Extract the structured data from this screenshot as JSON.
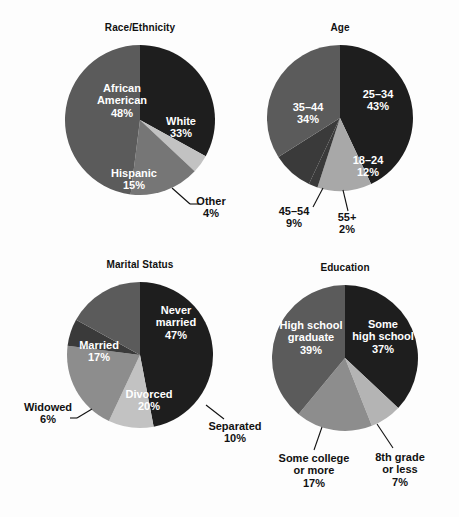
{
  "figure": {
    "background": "#fdfdfd",
    "width": 459,
    "height": 517
  },
  "palette": {
    "dark": "#1e1e1e",
    "mid_dark": "#3a3a3a",
    "mid": "#5b5b5b",
    "mid_light": "#767676",
    "light": "#a8a8a8",
    "lighter": "#c2c2c2",
    "label_inside": "#ffffff",
    "label_outside": "#111111"
  },
  "chart_data": [
    {
      "type": "pie",
      "title": "Race/Ethnicity",
      "categories": [
        "White",
        "Other",
        "Hispanic",
        "African American"
      ],
      "values": [
        33,
        4,
        15,
        48
      ],
      "labels": [
        "White\n33%",
        "Other\n4%",
        "Hispanic\n15%",
        "African\nAmerican\n48%"
      ],
      "colors": [
        "#1e1e1e",
        "#c2c2c2",
        "#767676",
        "#5b5b5b"
      ],
      "label_placement": [
        "inside",
        "outside",
        "inside",
        "inside"
      ],
      "start_angle_deg": 0,
      "legend": "none",
      "grid": false
    },
    {
      "type": "pie",
      "title": "Age",
      "categories": [
        "25–34",
        "18–24",
        "55+",
        "45–54",
        "35–44"
      ],
      "values": [
        43,
        12,
        2,
        9,
        34
      ],
      "labels": [
        "25–34\n43%",
        "18–24\n12%",
        "55+\n2%",
        "45–54\n9%",
        "35–44\n34%"
      ],
      "colors": [
        "#1e1e1e",
        "#a8a8a8",
        "#3a3a3a",
        "#3a3a3a",
        "#5b5b5b"
      ],
      "label_placement": [
        "inside",
        "inside",
        "outside",
        "outside",
        "inside"
      ],
      "start_angle_deg": 0,
      "legend": "none",
      "grid": false
    },
    {
      "type": "pie",
      "title": "Marital Status",
      "categories": [
        "Never married",
        "Separated",
        "Divorced",
        "Widowed",
        "Married"
      ],
      "values": [
        47,
        10,
        20,
        6,
        17
      ],
      "labels": [
        "Never\nmarried\n47%",
        "Separated\n10%",
        "Divorced\n20%",
        "Widowed\n6%",
        "Married\n17%"
      ],
      "colors": [
        "#1e1e1e",
        "#c2c2c2",
        "#8d8d8d",
        "#3a3a3a",
        "#5b5b5b"
      ],
      "label_placement": [
        "inside",
        "outside",
        "inside",
        "outside",
        "inside"
      ],
      "start_angle_deg": 0,
      "legend": "none",
      "grid": false
    },
    {
      "type": "pie",
      "title": "Education",
      "categories": [
        "Some high school",
        "8th grade or less",
        "Some college or more",
        "High school graduate"
      ],
      "values": [
        37,
        7,
        17,
        39
      ],
      "labels": [
        "Some\nhigh school\n37%",
        "8th grade\nor less\n7%",
        "Some college\nor more\n17%",
        "High school\ngraduate\n39%"
      ],
      "colors": [
        "#1e1e1e",
        "#b4b4b4",
        "#8d8d8d",
        "#5b5b5b"
      ],
      "label_placement": [
        "inside",
        "outside",
        "outside",
        "inside"
      ],
      "start_angle_deg": 0,
      "legend": "none",
      "grid": false
    }
  ],
  "panels": [
    {
      "id": "race-ethnicity",
      "title": "Race/Ethnicity",
      "center": {
        "x": 140,
        "y": 120
      },
      "radius": 75,
      "labels": [
        {
          "name": "slice-label-white",
          "text": "White\n33%",
          "x": 181,
          "y": 127,
          "placement": "inside"
        },
        {
          "name": "slice-label-other",
          "text": "Other\n4%",
          "x": 211,
          "y": 207,
          "placement": "outside"
        },
        {
          "name": "slice-label-hispanic",
          "text": "Hispanic\n15%",
          "x": 134,
          "y": 179,
          "placement": "inside"
        },
        {
          "name": "slice-label-african-american",
          "text": "African\nAmerican\n48%",
          "x": 122,
          "y": 100,
          "placement": "inside"
        }
      ],
      "leaders": [
        {
          "name": "leader-other",
          "x1": 172,
          "y1": 188,
          "x2": 190,
          "y2": 204,
          "x3": 199,
          "y3": 204
        }
      ]
    },
    {
      "id": "age",
      "title": "Age",
      "center": {
        "x": 340,
        "y": 118
      },
      "radius": 73,
      "labels": [
        {
          "name": "slice-label-25-34",
          "text": "25–34\n43%",
          "x": 378,
          "y": 100,
          "placement": "inside"
        },
        {
          "name": "slice-label-18-24",
          "text": "18–24\n12%",
          "x": 368,
          "y": 166,
          "placement": "inside"
        },
        {
          "name": "slice-label-55plus",
          "text": "55+\n2%",
          "x": 347,
          "y": 223,
          "placement": "outside"
        },
        {
          "name": "slice-label-45-54",
          "text": "45–54\n9%",
          "x": 294,
          "y": 217,
          "placement": "outside"
        },
        {
          "name": "slice-label-35-44",
          "text": "35–44\n34%",
          "x": 308,
          "y": 113,
          "placement": "inside"
        }
      ],
      "leaders": [
        {
          "name": "leader-55plus",
          "x1": 343,
          "y1": 190,
          "x2": 348,
          "y2": 211,
          "x3": 348,
          "y3": 211
        },
        {
          "name": "leader-45-54",
          "x1": 323,
          "y1": 188,
          "x2": 313,
          "y2": 207,
          "x3": 313,
          "y3": 207
        }
      ]
    },
    {
      "id": "marital-status",
      "title": "Marital Status",
      "center": {
        "x": 140,
        "y": 355
      },
      "radius": 73,
      "labels": [
        {
          "name": "slice-label-never-married",
          "text": "Never\nmarried\n47%",
          "x": 176,
          "y": 322,
          "placement": "inside"
        },
        {
          "name": "slice-label-separated",
          "text": "Separated\n10%",
          "x": 235,
          "y": 432,
          "placement": "outside"
        },
        {
          "name": "slice-label-divorced",
          "text": "Divorced\n20%",
          "x": 149,
          "y": 400,
          "placement": "inside"
        },
        {
          "name": "slice-label-widowed",
          "text": "Widowed\n6%",
          "x": 48,
          "y": 413,
          "placement": "outside"
        },
        {
          "name": "slice-label-married",
          "text": "Married\n17%",
          "x": 99,
          "y": 351,
          "placement": "inside"
        }
      ],
      "leaders": [
        {
          "name": "leader-separated",
          "x1": 206,
          "y1": 405,
          "x2": 224,
          "y2": 419,
          "x3": 224,
          "y3": 419
        },
        {
          "name": "leader-widowed",
          "x1": 92,
          "y1": 409,
          "x2": 77,
          "y2": 418,
          "x3": 70,
          "y3": 418
        }
      ]
    },
    {
      "id": "education",
      "title": "Education",
      "center": {
        "x": 345,
        "y": 358
      },
      "radius": 73,
      "labels": [
        {
          "name": "slice-label-some-high-school",
          "text": "Some\nhigh school\n37%",
          "x": 383,
          "y": 336,
          "placement": "inside"
        },
        {
          "name": "slice-label-8th-grade-or-less",
          "text": "8th grade\nor less\n7%",
          "x": 400,
          "y": 469,
          "placement": "outside"
        },
        {
          "name": "slice-label-some-college-or-more",
          "text": "Some college\nor more\n17%",
          "x": 314,
          "y": 470,
          "placement": "outside"
        },
        {
          "name": "slice-label-high-school-graduate",
          "text": "High school\ngraduate\n39%",
          "x": 311,
          "y": 337,
          "placement": "inside"
        }
      ],
      "leaders": [
        {
          "name": "leader-8th-grade",
          "x1": 377,
          "y1": 424,
          "x2": 393,
          "y2": 448,
          "x3": 393,
          "y3": 448
        },
        {
          "name": "leader-some-college",
          "x1": 322,
          "y1": 427,
          "x2": 314,
          "y2": 450,
          "x3": 314,
          "y3": 450
        }
      ]
    }
  ]
}
